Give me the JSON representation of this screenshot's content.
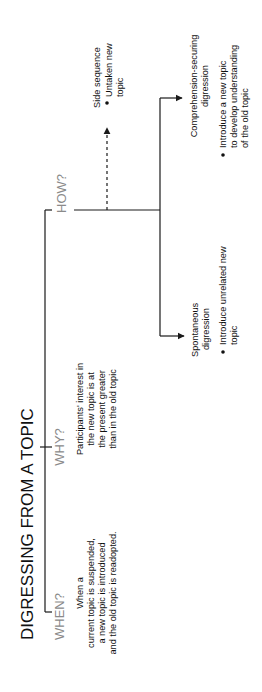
{
  "title": "DIGRESSING FROM A TOPIC",
  "when": {
    "label": "WHEN?",
    "lines": [
      "When a",
      "current topic is suspended,",
      "a new topic is introduced",
      "and the old topic is readopted."
    ]
  },
  "why": {
    "label": "WHY?",
    "lines": [
      "Participants' interest in",
      "the new topic is at",
      "the present greater",
      "than in the old topic"
    ]
  },
  "how": {
    "label": "HOW?",
    "side_sequence": {
      "title": "Side sequence",
      "bullet": [
        "Untaken new",
        "topic"
      ]
    },
    "comprehension": {
      "title": [
        "Comprehension-securing",
        "digression"
      ],
      "bullet": [
        "Introduce a new topic",
        "to develop understanding",
        "of the old topic"
      ]
    },
    "spontaneous": {
      "title": [
        "Spontaneous",
        "digression"
      ],
      "bullet": [
        "Introduce unrelated new",
        "topic"
      ]
    }
  },
  "colors": {
    "line": "#1a1a1a",
    "question": "#8a8a8a",
    "text": "#111111"
  }
}
